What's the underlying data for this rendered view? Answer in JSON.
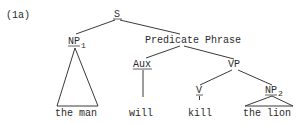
{
  "example_label": "(1a)",
  "nodes": {
    "s": {
      "label": "S"
    },
    "np1": {
      "label": "NP",
      "subscript": "1"
    },
    "predicate_phrase": {
      "label": "Predicate Phrase"
    },
    "aux": {
      "label": "Aux"
    },
    "vp": {
      "label": "VP"
    },
    "v": {
      "label": "V"
    },
    "np2": {
      "label": "NP",
      "subscript": "2"
    }
  },
  "leaves": {
    "np1": "the man",
    "aux": "will",
    "v": "kill",
    "np2": "the lion"
  },
  "colors": {
    "ink": "#2a2a2a",
    "background": "#ffffff"
  }
}
